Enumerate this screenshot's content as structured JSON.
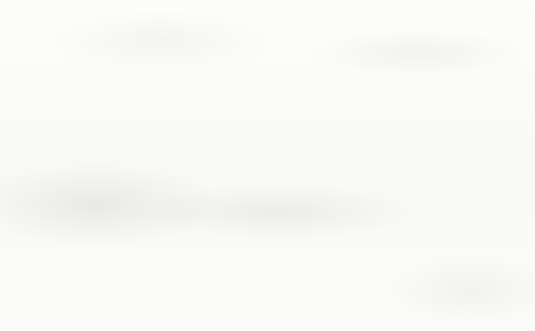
{
  "chart_data": {
    "type": "line",
    "title": "",
    "xlabel": "Elections",
    "ylabel": "Turnout %",
    "categories": [
      "1972",
      "1976",
      "1980",
      "1984",
      "1988",
      "1992",
      "1996",
      "2000",
      "2004",
      "2008"
    ],
    "values": [
      56.0,
      54.7,
      54.0,
      55.1,
      52.7,
      58.0,
      51.7,
      54.0,
      60.1,
      61.4
    ],
    "series": [
      {
        "name": "Turnout %",
        "values": [
          56.0,
          54.7,
          54.0,
          55.1,
          52.7,
          58.0,
          51.7,
          54.0,
          60.1,
          61.4
        ]
      }
    ],
    "xlim": [
      1970,
      2010
    ],
    "ylim": [
      48,
      64
    ],
    "yticks": [
      48,
      50,
      52,
      54,
      56,
      58,
      60,
      62,
      64
    ],
    "ytick_labels": [
      "48",
      "50",
      "52",
      "54",
      "56",
      "58",
      "60",
      "62",
      "64"
    ],
    "xticks": [
      1972,
      1976,
      1980,
      1984,
      1988,
      1992,
      1996,
      2000,
      2004,
      2008
    ],
    "grid": true,
    "grid_axis": "y",
    "legend": false,
    "legend_position": "none",
    "line_color": "#0c0c0c",
    "grid_color": "#4e4e4e",
    "axis_color": "#141414",
    "background_color": "#fbfbf9",
    "markers": false,
    "annotations": []
  }
}
